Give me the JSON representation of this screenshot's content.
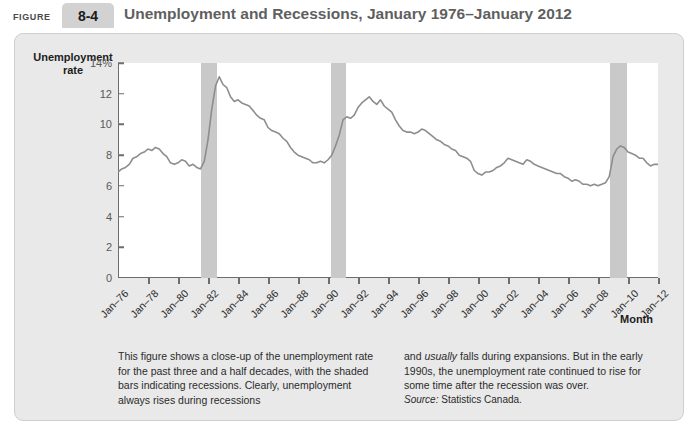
{
  "header": {
    "figure_word": "FIGURE",
    "figure_number": "8-4",
    "title": "Unemployment and Recessions, January 1976–January 2012"
  },
  "chart_data": {
    "type": "line",
    "title": "Unemployment and Recessions, January 1976–January 2012",
    "xlabel": "Month",
    "ylabel": "Unemployment rate",
    "ylim": [
      0,
      14
    ],
    "xlim": [
      "Jan-76",
      "Jan-12"
    ],
    "grid": false,
    "legend": "none",
    "line_color": "#8d8d8d",
    "recession_color": "#c9c9c9",
    "ytick_labels": [
      "14%",
      "12",
      "10",
      "8",
      "6",
      "4",
      "2",
      "0"
    ],
    "ytick_values": [
      14,
      12,
      10,
      8,
      6,
      4,
      2,
      0
    ],
    "xtick_labels": [
      "Jan–76",
      "Jan–78",
      "Jan–80",
      "Jan–82",
      "Jan–84",
      "Jan–86",
      "Jan–88",
      "Jan–90",
      "Jan–92",
      "Jan–94",
      "Jan–96",
      "Jan–98",
      "Jan–00",
      "Jan–02",
      "Jan–04",
      "Jan–06",
      "Jan–08",
      "Jan–10",
      "Jan–12"
    ],
    "xtick_values": [
      1976,
      1978,
      1980,
      1982,
      1984,
      1986,
      1988,
      1990,
      1992,
      1994,
      1996,
      1998,
      2000,
      2002,
      2004,
      2006,
      2008,
      2010,
      2012
    ],
    "recessions": [
      {
        "label": "1981-1982 recession",
        "start": 1981.5,
        "end": 1982.6
      },
      {
        "label": "1990-1992 recession",
        "start": 1990.2,
        "end": 1991.2
      },
      {
        "label": "2008-2009 recession",
        "start": 2008.8,
        "end": 2009.9
      }
    ],
    "series": [
      {
        "name": "Unemployment rate",
        "x": [
          1976.0,
          1976.25,
          1976.5,
          1976.75,
          1977.0,
          1977.25,
          1977.5,
          1977.75,
          1978.0,
          1978.25,
          1978.5,
          1978.75,
          1979.0,
          1979.25,
          1979.5,
          1979.75,
          1980.0,
          1980.25,
          1980.5,
          1980.75,
          1981.0,
          1981.25,
          1981.5,
          1981.75,
          1982.0,
          1982.25,
          1982.5,
          1982.75,
          1983.0,
          1983.25,
          1983.5,
          1983.75,
          1984.0,
          1984.25,
          1984.5,
          1984.75,
          1985.0,
          1985.25,
          1985.5,
          1985.75,
          1986.0,
          1986.25,
          1986.5,
          1986.75,
          1987.0,
          1987.25,
          1987.5,
          1987.75,
          1988.0,
          1988.25,
          1988.5,
          1988.75,
          1989.0,
          1989.25,
          1989.5,
          1989.75,
          1990.0,
          1990.25,
          1990.5,
          1990.75,
          1991.0,
          1991.25,
          1991.5,
          1991.75,
          1992.0,
          1992.25,
          1992.5,
          1992.75,
          1993.0,
          1993.25,
          1993.5,
          1993.75,
          1994.0,
          1994.25,
          1994.5,
          1994.75,
          1995.0,
          1995.25,
          1995.5,
          1995.75,
          1996.0,
          1996.25,
          1996.5,
          1996.75,
          1997.0,
          1997.25,
          1997.5,
          1997.75,
          1998.0,
          1998.25,
          1998.5,
          1998.75,
          1999.0,
          1999.25,
          1999.5,
          1999.75,
          2000.0,
          2000.25,
          2000.5,
          2000.75,
          2001.0,
          2001.25,
          2001.5,
          2001.75,
          2002.0,
          2002.25,
          2002.5,
          2002.75,
          2003.0,
          2003.25,
          2003.5,
          2003.75,
          2004.0,
          2004.25,
          2004.5,
          2004.75,
          2005.0,
          2005.25,
          2005.5,
          2005.75,
          2006.0,
          2006.25,
          2006.5,
          2006.75,
          2007.0,
          2007.25,
          2007.5,
          2007.75,
          2008.0,
          2008.25,
          2008.5,
          2008.75,
          2009.0,
          2009.25,
          2009.5,
          2009.75,
          2010.0,
          2010.25,
          2010.5,
          2010.75,
          2011.0,
          2011.25,
          2011.5,
          2011.75,
          2012.0
        ],
        "values": [
          6.9,
          7.1,
          7.2,
          7.4,
          7.8,
          7.9,
          8.1,
          8.2,
          8.4,
          8.3,
          8.5,
          8.4,
          8.1,
          7.9,
          7.5,
          7.4,
          7.5,
          7.7,
          7.6,
          7.3,
          7.4,
          7.2,
          7.1,
          7.6,
          9.0,
          11.0,
          12.5,
          13.1,
          12.6,
          12.4,
          11.8,
          11.5,
          11.6,
          11.4,
          11.3,
          11.2,
          10.9,
          10.6,
          10.4,
          10.3,
          9.8,
          9.6,
          9.5,
          9.4,
          9.1,
          8.9,
          8.5,
          8.2,
          8.0,
          7.9,
          7.8,
          7.7,
          7.5,
          7.5,
          7.6,
          7.5,
          7.7,
          8.0,
          8.6,
          9.3,
          10.3,
          10.5,
          10.4,
          10.6,
          11.1,
          11.4,
          11.6,
          11.8,
          11.5,
          11.3,
          11.6,
          11.2,
          11.0,
          10.8,
          10.3,
          9.9,
          9.6,
          9.5,
          9.5,
          9.4,
          9.5,
          9.7,
          9.6,
          9.4,
          9.2,
          9.0,
          8.9,
          8.7,
          8.6,
          8.4,
          8.3,
          8.0,
          7.9,
          7.8,
          7.6,
          7.0,
          6.8,
          6.7,
          6.9,
          6.9,
          7.0,
          7.2,
          7.3,
          7.5,
          7.8,
          7.7,
          7.6,
          7.5,
          7.4,
          7.7,
          7.6,
          7.4,
          7.3,
          7.2,
          7.1,
          7.0,
          6.9,
          6.8,
          6.8,
          6.6,
          6.5,
          6.3,
          6.4,
          6.3,
          6.1,
          6.1,
          6.0,
          6.1,
          6.0,
          6.1,
          6.2,
          6.6,
          7.9,
          8.4,
          8.6,
          8.5,
          8.2,
          8.1,
          8.0,
          7.8,
          7.8,
          7.5,
          7.3,
          7.4,
          7.4
        ]
      }
    ]
  },
  "caption": {
    "col1_text": "This figure shows a close-up of the unemployment rate for the past three and a half decades, with the shaded bars indicating recessions. Clearly, unemployment always rises during recessions",
    "col2_prefix": "and ",
    "col2_italic": "usually",
    "col2_rest": " falls during expansions. But in the early 1990s, the unemployment rate continued to rise for some time after the recession was over.",
    "source_label": "Source:",
    "source_value": " Statistics Canada."
  }
}
